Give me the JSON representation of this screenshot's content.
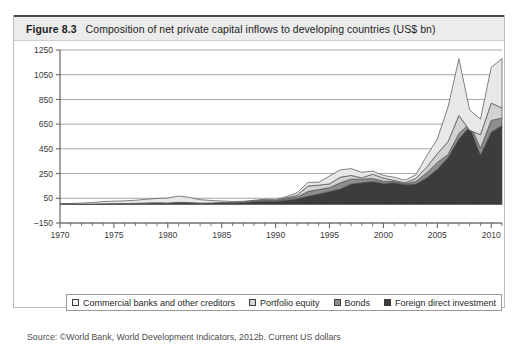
{
  "figure": {
    "number": "Figure 8.3",
    "title": "Composition of net private capital inflows to developing countries (US$ bn)",
    "source": "Source: ©World Bank, World Development Indicators, 2012b. Current US dollars"
  },
  "legend": {
    "items": [
      {
        "label": "Commercial banks and other creditors",
        "color": "#e8e8e8"
      },
      {
        "label": "Portfolio equity",
        "color": "#d2d2d2"
      },
      {
        "label": "Bonds",
        "color": "#8e8e8e"
      },
      {
        "label": "Foreign direct investment",
        "color": "#3c3c3c"
      }
    ]
  },
  "chart_data": {
    "type": "area",
    "stacked": true,
    "title": "Composition of net private capital inflows to developing countries (US$ bn)",
    "xlabel": "",
    "ylabel": "",
    "ylim": [
      -150,
      1250
    ],
    "ytick_values": [
      -150,
      50,
      250,
      450,
      650,
      850,
      1050,
      1250
    ],
    "ytick_labels": [
      "–150",
      "50",
      "250",
      "450",
      "650",
      "850",
      "1050",
      "1250"
    ],
    "xlim": [
      1970,
      2011
    ],
    "xtick_values": [
      1970,
      1975,
      1980,
      1985,
      1990,
      1995,
      2000,
      2005,
      2010
    ],
    "xtick_labels": [
      "1970",
      "1975",
      "1980",
      "1985",
      "1990",
      "1995",
      "2000",
      "2005",
      "2010"
    ],
    "grid": "horizontal",
    "legend_position": "bottom",
    "x": [
      1970,
      1971,
      1972,
      1973,
      1974,
      1975,
      1976,
      1977,
      1978,
      1979,
      1980,
      1981,
      1982,
      1983,
      1984,
      1985,
      1986,
      1987,
      1988,
      1989,
      1990,
      1991,
      1992,
      1993,
      1994,
      1995,
      1996,
      1997,
      1998,
      1999,
      2000,
      2001,
      2002,
      2003,
      2004,
      2005,
      2006,
      2007,
      2008,
      2009,
      2010,
      2011
    ],
    "series": [
      {
        "name": "Foreign direct investment",
        "color": "#3c3c3c",
        "values": [
          2,
          2,
          3,
          4,
          5,
          6,
          6,
          7,
          9,
          11,
          10,
          15,
          13,
          10,
          11,
          14,
          13,
          16,
          22,
          26,
          24,
          34,
          46,
          66,
          85,
          105,
          125,
          165,
          175,
          185,
          170,
          175,
          160,
          165,
          215,
          285,
          380,
          530,
          630,
          400,
          585,
          640
        ]
      },
      {
        "name": "Bonds",
        "color": "#8e8e8e",
        "values": [
          0,
          0,
          0,
          0,
          1,
          1,
          1,
          2,
          3,
          3,
          2,
          3,
          2,
          1,
          1,
          1,
          1,
          1,
          3,
          5,
          4,
          12,
          14,
          38,
          36,
          30,
          50,
          40,
          30,
          25,
          18,
          10,
          8,
          20,
          40,
          55,
          25,
          45,
          25,
          55,
          95,
          60
        ]
      },
      {
        "name": "Portfolio equity",
        "color": "#d2d2d2",
        "values": [
          0,
          0,
          0,
          0,
          0,
          0,
          0,
          0,
          0,
          0,
          0,
          0,
          0,
          0,
          0,
          1,
          2,
          3,
          4,
          6,
          4,
          8,
          14,
          45,
          35,
          32,
          45,
          30,
          10,
          35,
          25,
          10,
          8,
          25,
          45,
          70,
          105,
          145,
          -55,
          110,
          140,
          80
        ]
      },
      {
        "name": "Commercial banks and other creditors",
        "color": "#e8e8e8",
        "values": [
          5,
          6,
          8,
          12,
          18,
          20,
          22,
          25,
          30,
          35,
          40,
          50,
          42,
          28,
          20,
          12,
          8,
          6,
          5,
          6,
          8,
          10,
          22,
          30,
          24,
          63,
          60,
          55,
          45,
          25,
          22,
          25,
          20,
          30,
          90,
          120,
          280,
          460,
          165,
          125,
          290,
          400
        ]
      }
    ]
  }
}
